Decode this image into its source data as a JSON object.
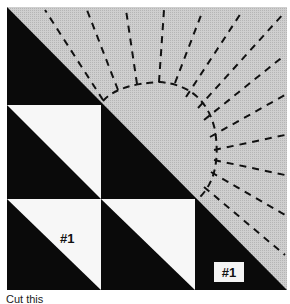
{
  "figure": {
    "type": "quilt-block-pattern",
    "colors": {
      "background": "#ffffff",
      "dark": "#0a0a0a",
      "light": "#f7f7f7",
      "shaded": "#c9c9c9",
      "dash": "#111111"
    },
    "labels": {
      "piece_left": "#1",
      "piece_right": "#1"
    },
    "caption": "Cut this"
  }
}
